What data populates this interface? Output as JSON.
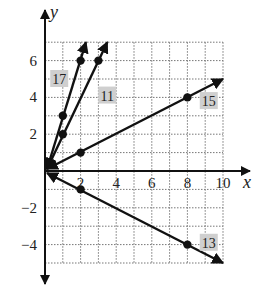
{
  "chart_data": {
    "type": "line",
    "title": "",
    "xlabel": "x",
    "ylabel": "y",
    "xlim": [
      0,
      10
    ],
    "ylim": [
      -5,
      7
    ],
    "grid": true,
    "grid_style": "dotted",
    "x_ticks": [
      2,
      4,
      6,
      8,
      10
    ],
    "x_tick_labels": [
      "2",
      "4",
      "6",
      "8",
      "10"
    ],
    "y_ticks": [
      -4,
      -2,
      2,
      4,
      6
    ],
    "y_tick_labels": [
      "−4",
      "−2",
      "2",
      "4",
      "6"
    ],
    "series": [
      {
        "name": "17",
        "equation": "y = 3x",
        "points": [
          [
            1,
            3
          ],
          [
            2,
            6
          ]
        ],
        "line_from": [
          0,
          0
        ],
        "line_to": [
          2.3,
          7
        ]
      },
      {
        "name": "11",
        "equation": "y = 2x",
        "points": [
          [
            1,
            2
          ],
          [
            3,
            6
          ]
        ],
        "line_from": [
          0,
          0
        ],
        "line_to": [
          3.5,
          7
        ]
      },
      {
        "name": "15",
        "equation": "y = 0.5x",
        "points": [
          [
            2,
            1
          ],
          [
            8,
            4
          ]
        ],
        "line_from": [
          0,
          0
        ],
        "line_to": [
          10,
          5
        ]
      },
      {
        "name": "13",
        "equation": "y = -0.5x",
        "points": [
          [
            2,
            -1
          ],
          [
            8,
            -4
          ]
        ],
        "line_from": [
          0,
          0
        ],
        "line_to": [
          10,
          -5
        ]
      }
    ],
    "annotations": [
      {
        "text": "17",
        "x": 0.8,
        "y": 5
      },
      {
        "text": "11",
        "x": 3.5,
        "y": 4.1
      },
      {
        "text": "15",
        "x": 9.2,
        "y": 3.8
      },
      {
        "text": "13",
        "x": 9.2,
        "y": -3.9
      }
    ],
    "legend": "none"
  }
}
